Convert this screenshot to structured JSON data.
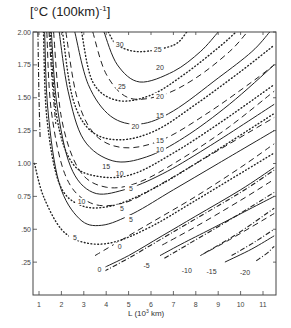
{
  "chart_data": {
    "type": "line",
    "title_main": "[°C (100km)",
    "title_sup": "-1",
    "xlabel": "L (10^3 km)",
    "xlabel_main": "L (10",
    "xlabel_sup": "3",
    "xlabel_tail": " km)",
    "ylabel": "",
    "xlim": [
      0.7,
      11.6
    ],
    "ylim": [
      0,
      2.0
    ],
    "x_ticks": [
      "1",
      "2",
      "3",
      "4",
      "5",
      "6",
      "7",
      "8",
      "9",
      "10",
      "11"
    ],
    "y_ticks": [
      ".25",
      ".50",
      "0.75",
      "1.00",
      "1.25",
      "1.50",
      "1.75",
      "2.00"
    ],
    "grid": false,
    "series": [
      {
        "name": "solid",
        "style": "solid",
        "contours": [
          {
            "level": "25",
            "points": [
              [
                3.9,
                2.0
              ],
              [
                4.5,
                1.75
              ],
              [
                5.5,
                1.62
              ],
              [
                7,
                1.7
              ],
              [
                8.2,
                1.85
              ],
              [
                9,
                2.0
              ]
            ]
          },
          {
            "level": "20",
            "points": [
              [
                2.6,
                2.0
              ],
              [
                3.2,
                1.6
              ],
              [
                4.2,
                1.36
              ],
              [
                5.5,
                1.3
              ],
              [
                7,
                1.4
              ],
              [
                9,
                1.65
              ],
              [
                10.5,
                1.85
              ],
              [
                11.3,
                2.0
              ]
            ]
          },
          {
            "level": "15",
            "points": [
              [
                1.9,
                2.0
              ],
              [
                2.3,
                1.55
              ],
              [
                3,
                1.18
              ],
              [
                4.3,
                1.02
              ],
              [
                5.8,
                1.05
              ],
              [
                7.5,
                1.2
              ],
              [
                9.5,
                1.45
              ],
              [
                11.5,
                1.75
              ]
            ]
          },
          {
            "level": "10",
            "points": [
              [
                1.55,
                2.0
              ],
              [
                1.8,
                1.45
              ],
              [
                2.4,
                0.98
              ],
              [
                3.4,
                0.78
              ],
              [
                4.8,
                0.8
              ],
              [
                6.5,
                0.92
              ],
              [
                8.5,
                1.12
              ],
              [
                11.5,
                1.45
              ]
            ]
          },
          {
            "level": "5",
            "points": [
              [
                1.25,
                2.0
              ],
              [
                1.4,
                1.4
              ],
              [
                1.9,
                0.85
              ],
              [
                2.8,
                0.58
              ],
              [
                3.8,
                0.53
              ],
              [
                5.2,
                0.62
              ],
              [
                7,
                0.8
              ],
              [
                9,
                1.0
              ],
              [
                11.5,
                1.25
              ]
            ]
          },
          {
            "level": "0",
            "points": [
              [
                3.8,
                0.2
              ],
              [
                5,
                0.3
              ],
              [
                6.5,
                0.45
              ],
              [
                8,
                0.6
              ],
              [
                10,
                0.8
              ],
              [
                11.5,
                0.97
              ]
            ]
          },
          {
            "level": "-5",
            "points": [
              [
                6.4,
                0.3
              ],
              [
                7.5,
                0.4
              ],
              [
                9,
                0.53
              ],
              [
                11.5,
                0.75
              ]
            ]
          },
          {
            "level": "-15",
            "points": [
              [
                9.3,
                0.25
              ],
              [
                10.5,
                0.35
              ],
              [
                11.5,
                0.45
              ]
            ]
          }
        ]
      },
      {
        "name": "dashed",
        "style": "dashed",
        "contours": [
          {
            "level": "20",
            "points": [
              [
                3.4,
                2.0
              ],
              [
                4,
                1.68
              ],
              [
                5,
                1.5
              ],
              [
                6.5,
                1.52
              ],
              [
                8,
                1.65
              ],
              [
                9.5,
                1.85
              ],
              [
                10.3,
                2.0
              ]
            ]
          },
          {
            "level": "15",
            "points": [
              [
                2.2,
                2.0
              ],
              [
                2.7,
                1.5
              ],
              [
                3.5,
                1.22
              ],
              [
                4.8,
                1.12
              ],
              [
                6.5,
                1.18
              ],
              [
                8.5,
                1.38
              ],
              [
                10.5,
                1.62
              ],
              [
                11.5,
                1.75
              ]
            ]
          },
          {
            "level": "10",
            "points": [
              [
                1.65,
                2.0
              ],
              [
                2,
                1.35
              ],
              [
                2.8,
                0.95
              ],
              [
                4,
                0.82
              ],
              [
                5.5,
                0.86
              ],
              [
                7.5,
                1.05
              ],
              [
                9.5,
                1.28
              ],
              [
                11.5,
                1.55
              ]
            ]
          },
          {
            "level": "5",
            "points": [
              [
                1.35,
                2.0
              ],
              [
                1.55,
                1.4
              ],
              [
                2.2,
                0.9
              ],
              [
                3.3,
                0.7
              ],
              [
                4.8,
                0.7
              ],
              [
                6.5,
                0.85
              ],
              [
                8.5,
                1.05
              ],
              [
                11.5,
                1.35
              ]
            ]
          },
          {
            "level": "0",
            "points": [
              [
                3.5,
                0.3
              ],
              [
                4.5,
                0.4
              ],
              [
                6,
                0.55
              ],
              [
                8,
                0.75
              ],
              [
                10,
                0.97
              ],
              [
                11.5,
                1.15
              ]
            ]
          },
          {
            "level": "-5",
            "points": [
              [
                6.5,
                0.38
              ],
              [
                8,
                0.52
              ],
              [
                10,
                0.72
              ],
              [
                11.5,
                0.88
              ]
            ]
          },
          {
            "level": "-10",
            "points": [
              [
                8.2,
                0.3
              ],
              [
                9.5,
                0.42
              ],
              [
                11.5,
                0.62
              ]
            ]
          }
        ]
      },
      {
        "name": "dotted",
        "style": "dotted",
        "contours": [
          {
            "level": "30",
            "points": [
              [
                4.1,
                2.0
              ],
              [
                4.5,
                1.9
              ],
              [
                5.5,
                1.85
              ],
              [
                7,
                1.9
              ],
              [
                7.6,
                2.0
              ]
            ]
          },
          {
            "level": "25",
            "points": [
              [
                2.9,
                2.0
              ],
              [
                3.4,
                1.62
              ],
              [
                4.5,
                1.48
              ],
              [
                6,
                1.52
              ],
              [
                7.5,
                1.68
              ],
              [
                9,
                1.88
              ],
              [
                9.8,
                2.0
              ]
            ]
          },
          {
            "level": "20",
            "points": [
              [
                2.05,
                2.0
              ],
              [
                2.5,
                1.5
              ],
              [
                3.3,
                1.25
              ],
              [
                4.6,
                1.18
              ],
              [
                6.2,
                1.25
              ],
              [
                8,
                1.45
              ],
              [
                10,
                1.7
              ],
              [
                11.5,
                1.9
              ]
            ]
          },
          {
            "level": "15",
            "points": [
              [
                1.5,
                2.0
              ],
              [
                1.8,
                1.35
              ],
              [
                2.5,
                1.0
              ],
              [
                3.7,
                0.9
              ],
              [
                5.2,
                0.92
              ],
              [
                7,
                1.08
              ],
              [
                9,
                1.3
              ],
              [
                11.5,
                1.6
              ]
            ]
          },
          {
            "level": "10",
            "points": [
              [
                1.2,
                2.0
              ],
              [
                1.35,
                1.35
              ],
              [
                1.9,
                0.85
              ],
              [
                2.9,
                0.68
              ],
              [
                4.3,
                0.68
              ],
              [
                6,
                0.8
              ],
              [
                8,
                1.0
              ],
              [
                11.5,
                1.38
              ]
            ]
          },
          {
            "level": "5",
            "points": [
              [
                0.8,
                1.0
              ],
              [
                1.2,
                0.75
              ],
              [
                2,
                0.5
              ],
              [
                3,
                0.4
              ],
              [
                4.3,
                0.4
              ],
              [
                6,
                0.52
              ],
              [
                8,
                0.72
              ],
              [
                11.5,
                1.08
              ]
            ]
          }
        ]
      },
      {
        "name": "dash-dot",
        "style": "dashdot",
        "contours": [
          {
            "level": "",
            "points": [
              [
                0.95,
                2.0
              ],
              [
                1.0,
                1.5
              ],
              [
                1.05,
                1.2
              ]
            ]
          },
          {
            "level": "",
            "points": [
              [
                1.45,
                2.0
              ],
              [
                1.6,
                1.6
              ],
              [
                1.75,
                1.3
              ]
            ]
          },
          {
            "level": "",
            "points": [
              [
                3.9,
                0.18
              ],
              [
                5,
                0.28
              ],
              [
                6.5,
                0.43
              ],
              [
                8,
                0.58
              ],
              [
                10,
                0.78
              ],
              [
                11.5,
                0.95
              ]
            ]
          },
          {
            "level": "-5",
            "points": [
              [
                6.6,
                0.28
              ],
              [
                7.8,
                0.4
              ],
              [
                9.5,
                0.57
              ],
              [
                11.5,
                0.78
              ]
            ]
          },
          {
            "level": "-10",
            "points": [
              [
                8.4,
                0.32
              ],
              [
                9.8,
                0.46
              ],
              [
                11.5,
                0.66
              ]
            ]
          },
          {
            "level": "-15",
            "points": [
              [
                9.6,
                0.3
              ],
              [
                10.6,
                0.4
              ],
              [
                11.5,
                0.5
              ]
            ]
          },
          {
            "level": "-20",
            "points": [
              [
                10.7,
                0.26
              ],
              [
                11.2,
                0.32
              ],
              [
                11.5,
                0.37
              ]
            ]
          }
        ]
      }
    ],
    "labels": [
      {
        "text": "30",
        "x": 4.6,
        "y": 1.9
      },
      {
        "text": "25",
        "x": 6.3,
        "y": 1.86
      },
      {
        "text": "20",
        "x": 6.4,
        "y": 1.72
      },
      {
        "text": "25",
        "x": 4.7,
        "y": 1.58
      },
      {
        "text": "20",
        "x": 6.4,
        "y": 1.5
      },
      {
        "text": "15",
        "x": 6.4,
        "y": 1.36
      },
      {
        "text": "20",
        "x": 5.3,
        "y": 1.27
      },
      {
        "text": "15",
        "x": 6.4,
        "y": 1.17
      },
      {
        "text": "10",
        "x": 6.4,
        "y": 1.1
      },
      {
        "text": "15",
        "x": 4.0,
        "y": 0.97
      },
      {
        "text": "10",
        "x": 4.6,
        "y": 0.92
      },
      {
        "text": "5",
        "x": 5.1,
        "y": 0.8
      },
      {
        "text": "10",
        "x": 2.9,
        "y": 0.7
      },
      {
        "text": "5",
        "x": 4.7,
        "y": 0.65
      },
      {
        "text": "5",
        "x": 5.1,
        "y": 0.57
      },
      {
        "text": "5",
        "x": 2.6,
        "y": 0.43
      },
      {
        "text": "0",
        "x": 4.6,
        "y": 0.36
      },
      {
        "text": "0",
        "x": 3.7,
        "y": 0.19
      },
      {
        "text": "-5",
        "x": 5.8,
        "y": 0.22
      },
      {
        "text": "-10",
        "x": 7.6,
        "y": 0.18
      },
      {
        "text": "-15",
        "x": 8.7,
        "y": 0.17
      },
      {
        "text": "-20",
        "x": 10.2,
        "y": 0.16
      }
    ]
  }
}
